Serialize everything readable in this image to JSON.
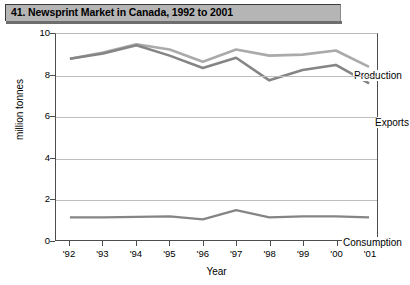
{
  "title": "41. Newsprint Market in Canada, 1992 to 2001",
  "axis": {
    "ylabel": "million tonnes",
    "xlabel": "Year",
    "yticks": [
      "10",
      "8",
      "6",
      "4",
      "2",
      "0"
    ],
    "xticks": [
      "'92",
      "'93",
      "'94",
      "'95",
      "'96",
      "'97",
      "'98",
      "'99",
      "'00",
      "'01"
    ]
  },
  "labels": {
    "production": "Production",
    "exports": "Exports",
    "consumption": "Consumption"
  },
  "colors": {
    "production": "#aaaaaa",
    "exports": "#858585",
    "consumption": "#858585",
    "title_bar": "#b5b5b5",
    "grid": "#bdbdbd",
    "axis": "#4d4d4d"
  },
  "chart_data": {
    "type": "line",
    "title": "41. Newsprint Market in Canada, 1992 to 2001",
    "xlabel": "Year",
    "ylabel": "million tonnes",
    "categories": [
      "'92",
      "'93",
      "'94",
      "'95",
      "'96",
      "'97",
      "'98",
      "'99",
      "'00",
      "'01"
    ],
    "x": [
      1992,
      1993,
      1994,
      1995,
      1996,
      1997,
      1998,
      1999,
      2000,
      2001
    ],
    "ylim": [
      0,
      10
    ],
    "yticks": [
      0,
      2,
      4,
      6,
      8,
      10
    ],
    "grid": true,
    "legend": "inline-annotations",
    "series": [
      {
        "name": "Production",
        "color": "#aaaaaa",
        "values": [
          8.8,
          9.1,
          9.5,
          9.25,
          8.65,
          9.25,
          8.95,
          9.0,
          9.2,
          8.4
        ]
      },
      {
        "name": "Exports",
        "color": "#858585",
        "values": [
          8.8,
          9.05,
          9.45,
          8.95,
          8.35,
          8.85,
          7.75,
          8.25,
          8.5,
          7.6
        ]
      },
      {
        "name": "Consumption",
        "color": "#858585",
        "values": [
          1.1,
          1.1,
          1.12,
          1.15,
          1.0,
          1.45,
          1.1,
          1.15,
          1.15,
          1.1
        ]
      }
    ]
  }
}
